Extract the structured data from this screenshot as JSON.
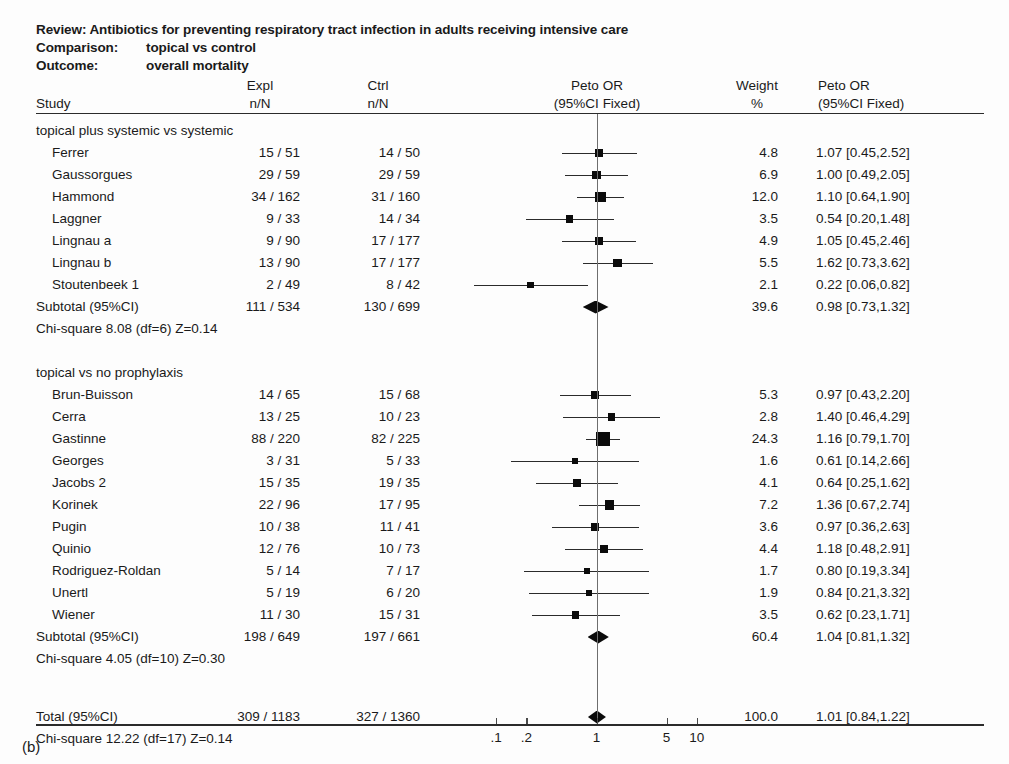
{
  "header": {
    "review": "Review: Antibiotics for preventing respiratory tract infection in adults receiving intensive care",
    "comparison_label": "Comparison:",
    "comparison_value": "topical  vs control",
    "outcome_label": "Outcome:",
    "outcome_value": "overall mortality"
  },
  "columns": {
    "study": "Study",
    "expl_top": "Expl",
    "expl_bottom": "n/N",
    "ctrl_top": "Ctrl",
    "ctrl_bottom": "n/N",
    "plot_top": "Peto OR",
    "plot_bottom": "(95%CI Fixed)",
    "weight_top": "Weight",
    "weight_bottom": "%",
    "or_top": "Peto OR",
    "or_bottom": "(95%CI Fixed)"
  },
  "figure_label": "(b)",
  "axis": {
    "ticks": [
      {
        "label": ".1",
        "value": 0.1
      },
      {
        "label": ".2",
        "value": 0.2
      },
      {
        "label": "1",
        "value": 1
      },
      {
        "label": "5",
        "value": 5
      },
      {
        "label": "10",
        "value": 10
      }
    ],
    "null_value": 1
  },
  "chart_data": {
    "type": "forest",
    "title": "Review: Antibiotics for preventing respiratory tract infection in adults receiving intensive care",
    "subtitle": "Comparison: topical  vs control / Outcome: overall mortality",
    "effect_measure": "Peto OR",
    "ci_model": "95%CI Fixed",
    "xlabel": "",
    "xscale": "log",
    "xlim": [
      0.07,
      16
    ],
    "xticks": [
      0.1,
      0.2,
      1,
      5,
      10
    ],
    "xticklabels": [
      ".1",
      ".2",
      "1",
      "5",
      "10"
    ],
    "null_line": 1,
    "groups": [
      {
        "name": "topical plus systemic vs systemic",
        "rows": [
          {
            "study": "Ferrer",
            "expl": "15 / 51",
            "ctrl": "14 / 50",
            "weight": "4.8",
            "or_text": "1.07 [0.45,2.52]",
            "or": 1.07,
            "lo": 0.45,
            "hi": 2.52
          },
          {
            "study": "Gaussorgues",
            "expl": "29 / 59",
            "ctrl": "29 / 59",
            "weight": "6.9",
            "or_text": "1.00 [0.49,2.05]",
            "or": 1.0,
            "lo": 0.49,
            "hi": 2.05
          },
          {
            "study": "Hammond",
            "expl": "34 / 162",
            "ctrl": "31 / 160",
            "weight": "12.0",
            "or_text": "1.10 [0.64,1.90]",
            "or": 1.1,
            "lo": 0.64,
            "hi": 1.9
          },
          {
            "study": "Laggner",
            "expl": "9 / 33",
            "ctrl": "14 / 34",
            "weight": "3.5",
            "or_text": "0.54 [0.20,1.48]",
            "or": 0.54,
            "lo": 0.2,
            "hi": 1.48
          },
          {
            "study": "Lingnau a",
            "expl": "9 / 90",
            "ctrl": "17 / 177",
            "weight": "4.9",
            "or_text": "1.05 [0.45,2.46]",
            "or": 1.05,
            "lo": 0.45,
            "hi": 2.46
          },
          {
            "study": "Lingnau b",
            "expl": "13 / 90",
            "ctrl": "17 / 177",
            "weight": "5.5",
            "or_text": "1.62 [0.73,3.62]",
            "or": 1.62,
            "lo": 0.73,
            "hi": 3.62
          },
          {
            "study": "Stoutenbeek 1",
            "expl": "2 / 49",
            "ctrl": "8 / 42",
            "weight": "2.1",
            "or_text": "0.22 [0.06,0.82]",
            "or": 0.22,
            "lo": 0.06,
            "hi": 0.82
          }
        ],
        "subtotal": {
          "study": "Subtotal (95%CI)",
          "expl": "111 / 534",
          "ctrl": "130 / 699",
          "weight": "39.6",
          "or_text": "0.98 [0.73,1.32]",
          "or": 0.98,
          "lo": 0.73,
          "hi": 1.32
        },
        "heterogeneity": "Chi-square 8.08 (df=6)  Z=0.14"
      },
      {
        "name": "topical vs no prophylaxis",
        "rows": [
          {
            "study": "Brun-Buisson",
            "expl": "14 / 65",
            "ctrl": "15 / 68",
            "weight": "5.3",
            "or_text": "0.97 [0.43,2.20]",
            "or": 0.97,
            "lo": 0.43,
            "hi": 2.2
          },
          {
            "study": "Cerra",
            "expl": "13 / 25",
            "ctrl": "10 / 23",
            "weight": "2.8",
            "or_text": "1.40 [0.46,4.29]",
            "or": 1.4,
            "lo": 0.46,
            "hi": 4.29
          },
          {
            "study": "Gastinne",
            "expl": "88 / 220",
            "ctrl": "82 / 225",
            "weight": "24.3",
            "or_text": "1.16 [0.79,1.70]",
            "or": 1.16,
            "lo": 0.79,
            "hi": 1.7
          },
          {
            "study": "Georges",
            "expl": "3 / 31",
            "ctrl": "5 / 33",
            "weight": "1.6",
            "or_text": "0.61 [0.14,2.66]",
            "or": 0.61,
            "lo": 0.14,
            "hi": 2.66
          },
          {
            "study": "Jacobs 2",
            "expl": "15 / 35",
            "ctrl": "19 / 35",
            "weight": "4.1",
            "or_text": "0.64 [0.25,1.62]",
            "or": 0.64,
            "lo": 0.25,
            "hi": 1.62
          },
          {
            "study": "Korinek",
            "expl": "22 / 96",
            "ctrl": "17 / 95",
            "weight": "7.2",
            "or_text": "1.36 [0.67,2.74]",
            "or": 1.36,
            "lo": 0.67,
            "hi": 2.74
          },
          {
            "study": "Pugin",
            "expl": "10 / 38",
            "ctrl": "11 / 41",
            "weight": "3.6",
            "or_text": "0.97 [0.36,2.63]",
            "or": 0.97,
            "lo": 0.36,
            "hi": 2.63
          },
          {
            "study": "Quinio",
            "expl": "12 / 76",
            "ctrl": "10 / 73",
            "weight": "4.4",
            "or_text": "1.18 [0.48,2.91]",
            "or": 1.18,
            "lo": 0.48,
            "hi": 2.91
          },
          {
            "study": "Rodriguez-Roldan",
            "expl": "5 / 14",
            "ctrl": "7 / 17",
            "weight": "1.7",
            "or_text": "0.80 [0.19,3.34]",
            "or": 0.8,
            "lo": 0.19,
            "hi": 3.34
          },
          {
            "study": "Unertl",
            "expl": "5 / 19",
            "ctrl": "6 / 20",
            "weight": "1.9",
            "or_text": "0.84 [0.21,3.32]",
            "or": 0.84,
            "lo": 0.21,
            "hi": 3.32
          },
          {
            "study": "Wiener",
            "expl": "11 / 30",
            "ctrl": "15 / 31",
            "weight": "3.5",
            "or_text": "0.62 [0.23,1.71]",
            "or": 0.62,
            "lo": 0.23,
            "hi": 1.71
          }
        ],
        "subtotal": {
          "study": "Subtotal (95%CI)",
          "expl": "198 / 649",
          "ctrl": "197 / 661",
          "weight": "60.4",
          "or_text": "1.04 [0.81,1.32]",
          "or": 1.04,
          "lo": 0.81,
          "hi": 1.32
        },
        "heterogeneity": "Chi-square 4.05 (df=10)  Z=0.30"
      }
    ],
    "total": {
      "study": "Total (95%CI)",
      "expl": "309 / 1183",
      "ctrl": "327 / 1360",
      "weight": "100.0",
      "or_text": "1.01 [0.84,1.22]",
      "or": 1.01,
      "lo": 0.84,
      "hi": 1.22,
      "heterogeneity": "Chi-square 12.22 (df=17)  Z=0.14"
    }
  }
}
